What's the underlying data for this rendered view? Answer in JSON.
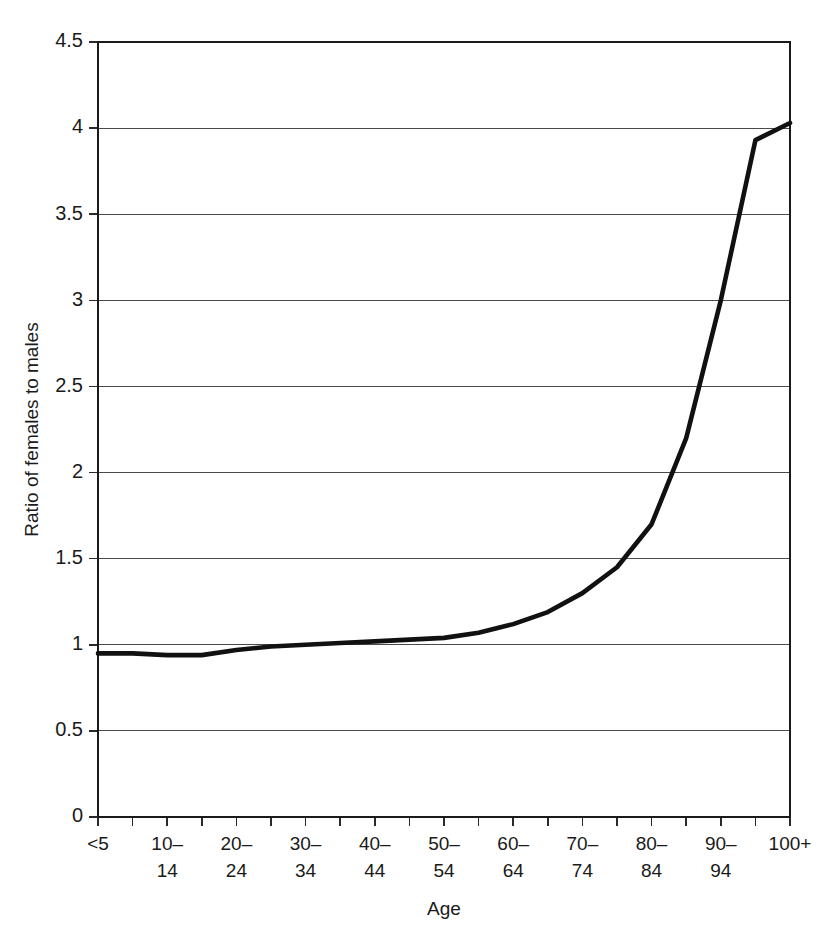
{
  "chart_data": {
    "type": "line",
    "title": "",
    "xlabel": "Age",
    "ylabel": "Ratio of females to males",
    "categories": [
      "<5",
      "5–9",
      "10–14",
      "15–19",
      "20–24",
      "25–29",
      "30–34",
      "35–39",
      "40–44",
      "45–49",
      "50–54",
      "55–59",
      "60–64",
      "65–69",
      "70–74",
      "75–79",
      "80–84",
      "85–89",
      "90–94",
      "95–99",
      "100+"
    ],
    "values": [
      0.95,
      0.95,
      0.94,
      0.94,
      0.97,
      0.99,
      1.0,
      1.01,
      1.02,
      1.03,
      1.04,
      1.07,
      1.12,
      1.19,
      1.3,
      1.45,
      1.7,
      2.2,
      3.0,
      3.93,
      4.03
    ],
    "ylim": [
      0,
      4.5
    ],
    "ytick_labels": [
      "0",
      "0.5",
      "1",
      "1.5",
      "2",
      "2.5",
      "3",
      "3.5",
      "4",
      "4.5"
    ],
    "ytick_values": [
      0,
      0.5,
      1,
      1.5,
      2,
      2.5,
      3,
      3.5,
      4,
      4.5
    ],
    "xtick_labels": [
      {
        "line1": "<5",
        "line2": ""
      },
      {
        "line1": "10–",
        "line2": "14"
      },
      {
        "line1": "20–",
        "line2": "24"
      },
      {
        "line1": "30–",
        "line2": "34"
      },
      {
        "line1": "40–",
        "line2": "44"
      },
      {
        "line1": "50–",
        "line2": "54"
      },
      {
        "line1": "60–",
        "line2": "64"
      },
      {
        "line1": "70–",
        "line2": "74"
      },
      {
        "line1": "80–",
        "line2": "84"
      },
      {
        "line1": "90–",
        "line2": "94"
      },
      {
        "line1": "100+",
        "line2": ""
      }
    ],
    "grid": true,
    "legend": "none",
    "line_color": "#111111",
    "grid_color": "#4a4a4a",
    "background_color": "#ffffff"
  }
}
